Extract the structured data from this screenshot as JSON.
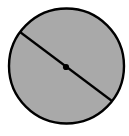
{
  "figure": {
    "canvas": {
      "width": 129,
      "height": 136,
      "background_color": "#ffffff"
    },
    "circle": {
      "label": "circle",
      "center_x": 66.5,
      "center_y": 66.0,
      "radius": 57.5,
      "fill_color": "#a9a9a9",
      "stroke_color": "#000000",
      "stroke_width": 2.4
    },
    "diameter": {
      "label": "diameter",
      "x1": 20.0,
      "y1": 32.0,
      "x2": 112.0,
      "y2": 101.0,
      "stroke_color": "#000000",
      "stroke_width": 2.2
    },
    "center_point": {
      "label": "center point",
      "x": 66.0,
      "y": 67.0,
      "radius": 3.1,
      "fill_color": "#000000"
    }
  },
  "chart_data": {
    "type": "diagram",
    "shapes": [
      {
        "kind": "circle",
        "center": [
          66.5,
          66.0
        ],
        "radius": 57.5,
        "fill": "#a9a9a9",
        "stroke": "#000000",
        "stroke_width": 2.4
      },
      {
        "kind": "line",
        "name": "diameter",
        "from": [
          20.0,
          32.0
        ],
        "to": [
          112.0,
          101.0
        ],
        "stroke": "#000000",
        "stroke_width": 2.2
      },
      {
        "kind": "point",
        "name": "center",
        "at": [
          66.0,
          67.0
        ],
        "radius": 3.1,
        "fill": "#000000"
      }
    ],
    "annotations": [],
    "legend": [],
    "xlabel": "",
    "ylabel": ""
  }
}
